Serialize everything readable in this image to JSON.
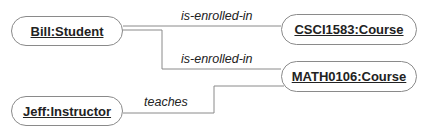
{
  "diagram": {
    "type": "object-diagram",
    "nodes": [
      {
        "id": "bill",
        "label": "Bill:Student"
      },
      {
        "id": "csci",
        "label": "CSCI1583:Course"
      },
      {
        "id": "math",
        "label": "MATH0106:Course"
      },
      {
        "id": "jeff",
        "label": "Jeff:Instructor"
      }
    ],
    "edges": [
      {
        "from": "bill",
        "to": "csci",
        "label": "is-enrolled-in"
      },
      {
        "from": "bill",
        "to": "math",
        "label": "is-enrolled-in"
      },
      {
        "from": "jeff",
        "to": "math",
        "label": "teaches"
      }
    ],
    "colors": {
      "line": "#8a8a8a",
      "text": "#222222",
      "background": "#ffffff"
    }
  }
}
